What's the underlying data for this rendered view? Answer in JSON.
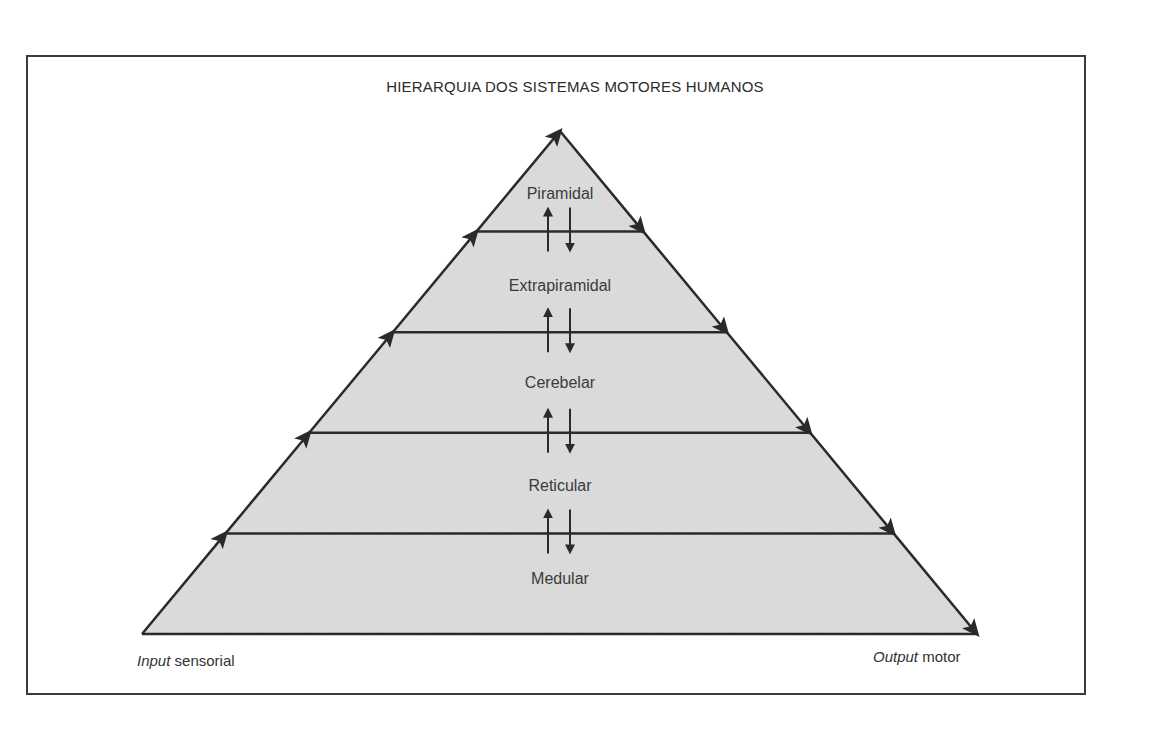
{
  "diagram": {
    "title": "HIERARQUIA DOS SISTEMAS MOTORES HUMANOS",
    "levels": [
      {
        "name": "Piramidal"
      },
      {
        "name": "Extrapiramidal"
      },
      {
        "name": "Cerebelar"
      },
      {
        "name": "Reticular"
      },
      {
        "name": "Medular"
      }
    ],
    "input_label": {
      "italic": "Input",
      "rest": " sensorial"
    },
    "output_label": {
      "italic": "Output",
      "rest": " motor"
    },
    "colors": {
      "fill": "#d9d9d9",
      "stroke": "#2a2a2a",
      "text": "#3a3a3a"
    }
  }
}
